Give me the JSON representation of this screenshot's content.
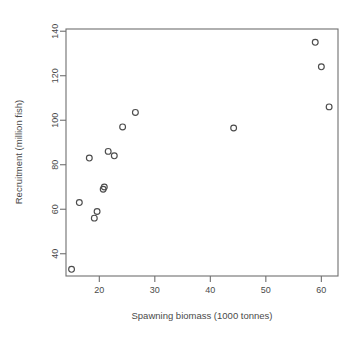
{
  "chart_data": {
    "type": "scatter",
    "title": "",
    "xlabel": "Spawning biomass (1000 tonnes)",
    "ylabel": "Recruitment (million fish)",
    "xlim": [
      14.0,
      63.0
    ],
    "ylim": [
      30.0,
      141.0
    ],
    "xticks": [
      20,
      30,
      40,
      50,
      60
    ],
    "yticks": [
      40,
      60,
      80,
      100,
      120,
      140
    ],
    "xtick_labels": [
      "20",
      "30",
      "40",
      "50",
      "60"
    ],
    "ytick_labels": [
      "40",
      "60",
      "80",
      "100",
      "120",
      "140"
    ],
    "grid": false,
    "legend": null,
    "marker": "open-circle",
    "series": [
      {
        "name": "recruitment-vs-biomass",
        "points": [
          {
            "x": 15.0,
            "y": 33.0
          },
          {
            "x": 16.4,
            "y": 63.0
          },
          {
            "x": 18.2,
            "y": 83.0
          },
          {
            "x": 19.1,
            "y": 56.0
          },
          {
            "x": 19.6,
            "y": 59.0
          },
          {
            "x": 20.7,
            "y": 69.0
          },
          {
            "x": 20.9,
            "y": 70.0
          },
          {
            "x": 21.6,
            "y": 86.0
          },
          {
            "x": 22.7,
            "y": 84.0
          },
          {
            "x": 24.2,
            "y": 97.0
          },
          {
            "x": 26.5,
            "y": 103.5
          },
          {
            "x": 44.2,
            "y": 96.5
          },
          {
            "x": 58.9,
            "y": 135.0
          },
          {
            "x": 60.0,
            "y": 124.0
          },
          {
            "x": 61.4,
            "y": 106.0
          }
        ]
      }
    ]
  },
  "axes": {
    "x_label": "Spawning biomass (1000 tonnes)",
    "y_label": "Recruitment (million fish)"
  },
  "colors": {
    "frame": "#6f6f6f",
    "marker": "#4c4c4c",
    "text": "#4a4a4a",
    "background": "#ffffff"
  }
}
